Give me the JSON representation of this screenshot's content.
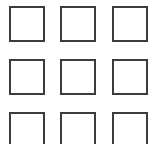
{
  "canvas": {
    "width": 153,
    "height": 144,
    "background_color": "#ffffff",
    "description": "grid-of-empty-squares"
  },
  "grid": {
    "rows": 3,
    "columns": 3,
    "cell_width": 36,
    "cell_height": 36,
    "column_pitch": 51.5,
    "row_pitch": 53,
    "origin_x": 9,
    "origin_y": 6,
    "border_width": 2,
    "border_color": "#3c3c3c",
    "fill_color": "#ffffff",
    "last_row_clipped": true,
    "cells": [
      {
        "id": "cell-r1-c1",
        "row": 1,
        "col": 1,
        "x": 9,
        "y": 6,
        "w": 36,
        "h": 36,
        "clipped": false
      },
      {
        "id": "cell-r1-c2",
        "row": 1,
        "col": 2,
        "x": 60,
        "y": 6,
        "w": 36,
        "h": 36,
        "clipped": false
      },
      {
        "id": "cell-r1-c3",
        "row": 1,
        "col": 3,
        "x": 112,
        "y": 6,
        "w": 36,
        "h": 36,
        "clipped": false
      },
      {
        "id": "cell-r2-c1",
        "row": 2,
        "col": 1,
        "x": 9,
        "y": 59,
        "w": 36,
        "h": 36,
        "clipped": false
      },
      {
        "id": "cell-r2-c2",
        "row": 2,
        "col": 2,
        "x": 60,
        "y": 59,
        "w": 36,
        "h": 36,
        "clipped": false
      },
      {
        "id": "cell-r2-c3",
        "row": 2,
        "col": 3,
        "x": 112,
        "y": 59,
        "w": 36,
        "h": 36,
        "clipped": false
      },
      {
        "id": "cell-r3-c1",
        "row": 3,
        "col": 1,
        "x": 9,
        "y": 112,
        "w": 36,
        "h": 36,
        "clipped": true
      },
      {
        "id": "cell-r3-c2",
        "row": 3,
        "col": 2,
        "x": 60,
        "y": 112,
        "w": 36,
        "h": 36,
        "clipped": true
      },
      {
        "id": "cell-r3-c3",
        "row": 3,
        "col": 3,
        "x": 112,
        "y": 112,
        "w": 36,
        "h": 36,
        "clipped": true
      }
    ]
  }
}
